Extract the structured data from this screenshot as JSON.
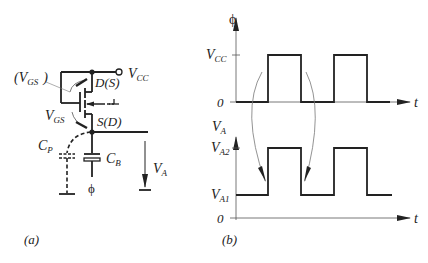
{
  "panel_a": {
    "caption": "(a)",
    "labels": {
      "vgs_paren_open": "(V",
      "vgs_paren_sub": "GS",
      "vgs_paren_close": ")",
      "vgs": "V",
      "vgs_sub": "GS",
      "drain": "D(S)",
      "source": "S(D)",
      "vcc": "V",
      "vcc_sub": "CC",
      "cp": "C",
      "cp_sub": "P",
      "cb": "C",
      "cb_sub": "B",
      "phi": "ϕ",
      "va": "V",
      "va_sub": "A"
    }
  },
  "panel_b": {
    "caption": "(b)",
    "top_plot": {
      "y_label": "ϕ",
      "x_label": "t",
      "tick_high": "V",
      "tick_high_sub": "CC",
      "tick_zero": "0"
    },
    "bottom_plot": {
      "y_label": "V",
      "y_label_sub": "A",
      "x_label": "t",
      "tick_high": "V",
      "tick_high_sub": "A2",
      "tick_low": "V",
      "tick_low_sub": "A1",
      "tick_zero": "0"
    }
  },
  "colors": {
    "line": "#222222",
    "thin": "#555555"
  }
}
